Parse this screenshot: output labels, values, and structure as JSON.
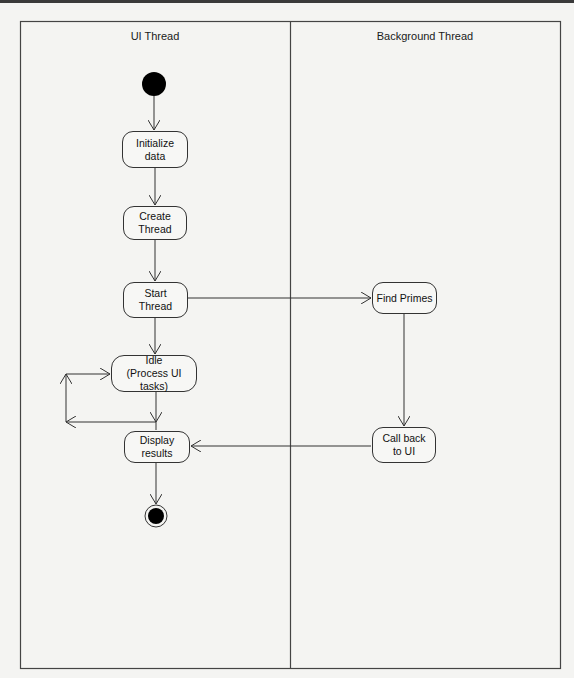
{
  "diagram": {
    "type": "UML activity diagram with swimlanes",
    "lanes": [
      {
        "id": "ui",
        "title": "UI Thread"
      },
      {
        "id": "bg",
        "title": "Background Thread"
      }
    ],
    "nodes": {
      "start": {
        "kind": "initial",
        "lane": "ui"
      },
      "init": {
        "label": "Initialize data",
        "lane": "ui"
      },
      "create": {
        "label": "Create Thread",
        "lane": "ui"
      },
      "start_thread": {
        "label": "Start Thread",
        "lane": "ui"
      },
      "idle": {
        "label": "Idle (Process UI tasks)",
        "lane": "ui"
      },
      "display": {
        "label": "Display results",
        "lane": "ui"
      },
      "end": {
        "kind": "final",
        "lane": "ui"
      },
      "find": {
        "label": "Find Primes",
        "lane": "bg"
      },
      "callback": {
        "label": "Call back to UI",
        "lane": "bg"
      }
    },
    "edges": [
      {
        "from": "start",
        "to": "init"
      },
      {
        "from": "init",
        "to": "create"
      },
      {
        "from": "create",
        "to": "start_thread"
      },
      {
        "from": "start_thread",
        "to": "idle"
      },
      {
        "from": "start_thread",
        "to": "find"
      },
      {
        "from": "idle",
        "to": "idle",
        "note": "loop"
      },
      {
        "from": "idle",
        "to": "display"
      },
      {
        "from": "find",
        "to": "callback"
      },
      {
        "from": "callback",
        "to": "display"
      },
      {
        "from": "display",
        "to": "end"
      }
    ],
    "labels": {
      "init": "Initialize data",
      "create_1": "Create",
      "create_2": "Thread",
      "start_1": "Start",
      "start_2": "Thread",
      "idle_1": "Idle",
      "idle_2": "(Process UI tasks)",
      "display_1": "Display",
      "display_2": "results",
      "find": "Find Primes",
      "callback_1": "Call back",
      "callback_2": "to UI"
    },
    "colors": {
      "line": "#333333",
      "background": "#f4f4f2",
      "node_fill": "#000000"
    }
  }
}
